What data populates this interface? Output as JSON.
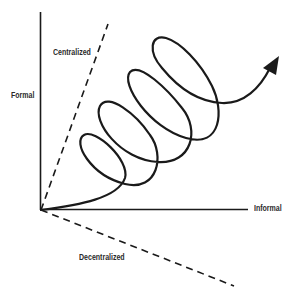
{
  "diagram": {
    "labels": {
      "formal": "Formal",
      "informal": "Informal",
      "centralized": "Centralized",
      "decentralized": "Decentralized"
    },
    "colors": {
      "stroke": "#1a1a1a",
      "background": "#ffffff"
    },
    "elements": {
      "vertical_axis": "Formal axis (solid)",
      "horizontal_axis": "Informal axis (solid)",
      "upper_dashed_line": "Centralized boundary (dashed)",
      "lower_dashed_line": "Decentralized boundary (dashed)",
      "spiral_arrow": "Spiral path with 4 loops ending in arrowhead pointing up-right"
    }
  }
}
